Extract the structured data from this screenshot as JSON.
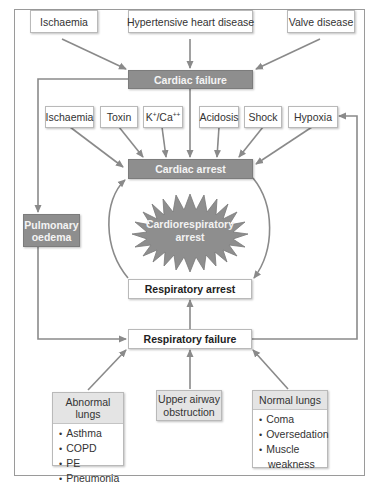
{
  "colors": {
    "dark_box": "#8e8e8e",
    "light_box": "#e4e4e4",
    "arrow": "#8a8a8a",
    "border": "#b9b9b9"
  },
  "top_causes": [
    {
      "label": "Ischaemia"
    },
    {
      "label": "Hypertensive heart disease"
    },
    {
      "label": "Valve disease"
    }
  ],
  "cardiac_failure": {
    "label": "Cardiac failure"
  },
  "arrest_causes": [
    {
      "label": "Ischaemia"
    },
    {
      "label": "Toxin"
    },
    {
      "label_base_k": "K",
      "sup_k": "+",
      "slash": "/Ca",
      "sup_ca": "++"
    },
    {
      "label": "Acidosis"
    },
    {
      "label": "Shock"
    },
    {
      "label": "Hypoxia"
    }
  ],
  "cardiac_arrest": {
    "label": "Cardiac arrest"
  },
  "pulmonary_oedema": {
    "line1": "Pulmonary",
    "line2": "oedema"
  },
  "cardiorespiratory_arrest": {
    "line1": "Cardiorespiratory",
    "line2": "arrest"
  },
  "respiratory_arrest": {
    "label": "Respiratory arrest"
  },
  "respiratory_failure": {
    "label": "Respiratory failure"
  },
  "bottom_causes": {
    "abnormal_lungs": {
      "header": "Abnormal lungs",
      "items": [
        "Asthma",
        "COPD",
        "PE",
        "Pneumonia"
      ]
    },
    "upper_airway": {
      "line1": "Upper airway",
      "line2": "obstruction"
    },
    "normal_lungs": {
      "header": "Normal lungs",
      "items": [
        "Coma",
        "Oversedation",
        "Muscle",
        "weakness"
      ]
    }
  }
}
